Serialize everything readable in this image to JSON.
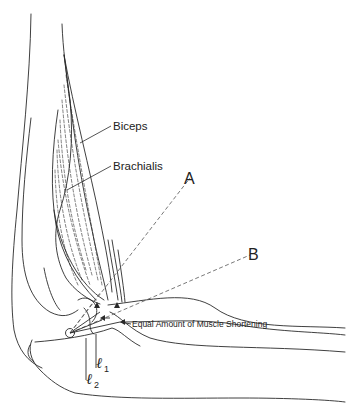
{
  "figure": {
    "labels": {
      "biceps": "Biceps",
      "brachialis": "Brachialis",
      "line_a": "A",
      "line_b": "B",
      "shortening": "Equal Amount of Muscle Shortening",
      "l1_symbol": "ℓ",
      "l1_sub": "1",
      "l2_symbol": "ℓ",
      "l2_sub": "2"
    },
    "colors": {
      "ink": "#2a2a2a",
      "background": "#ffffff"
    }
  }
}
